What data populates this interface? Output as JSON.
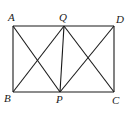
{
  "diagram": {
    "type": "geometry",
    "points": [
      {
        "name": "A",
        "x": 13,
        "y": 26,
        "label_x": 8,
        "label_y": 21
      },
      {
        "name": "Q",
        "x": 64,
        "y": 26,
        "label_x": 59,
        "label_y": 21
      },
      {
        "name": "D",
        "x": 114,
        "y": 26,
        "label_x": 116,
        "label_y": 23
      },
      {
        "name": "B",
        "x": 13,
        "y": 92,
        "label_x": 4,
        "label_y": 102
      },
      {
        "name": "P",
        "x": 60,
        "y": 92,
        "label_x": 56,
        "label_y": 103
      },
      {
        "name": "C",
        "x": 114,
        "y": 92,
        "label_x": 112,
        "label_y": 104
      }
    ],
    "segments": [
      [
        "A",
        "Q"
      ],
      [
        "Q",
        "D"
      ],
      [
        "B",
        "P"
      ],
      [
        "P",
        "C"
      ],
      [
        "A",
        "B"
      ],
      [
        "D",
        "C"
      ],
      [
        "A",
        "P"
      ],
      [
        "B",
        "Q"
      ],
      [
        "Q",
        "P"
      ],
      [
        "Q",
        "C"
      ],
      [
        "P",
        "D"
      ]
    ],
    "labels": {
      "A": "A",
      "Q": "Q",
      "D": "D",
      "B": "B",
      "P": "P",
      "C": "C"
    }
  }
}
